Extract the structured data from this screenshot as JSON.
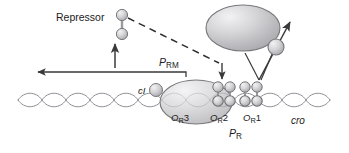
{
  "figure": {
    "background_color": "#ffffff"
  },
  "labels": {
    "repressor": "Repressor",
    "ci": "cI",
    "cro": "cro",
    "promoter_prm_base": "P",
    "promoter_prm_sub": "RM",
    "promoter_pr_base": "P",
    "promoter_pr_sub": "R",
    "or3_base": "O",
    "or3_sub": "R",
    "or3_num": "3",
    "or2_base": "O",
    "or2_sub": "R",
    "or2_num": "2",
    "or1_base": "O",
    "or1_sub": "R",
    "or1_num": "1"
  },
  "colors": {
    "dna_strand": "#8d8f96",
    "molecule_fill_light": "#e9e9ea",
    "molecule_fill_mid": "#bdbdc0",
    "molecule_fill_dark": "#9a9a9e",
    "molecule_stroke": "#78787c",
    "arrow": "#3a3a3a",
    "dashed_line": "#2e2e2e",
    "text": "#1c1c1c"
  },
  "elements": {
    "rna_polymerase_ellipse": "large gray ellipse representing RNA polymerase",
    "rna_polymerase_sigma": "small gray circle attached to polymerase",
    "repressor_dimer_free": "two stacked gray circles (free repressor dimer)",
    "ci_monomer_circle": "small gray circle left of OR3 bound protein",
    "or3_bound_protein": "large semi-transparent ellipse bound over OR3",
    "or2_dimer": "repressor dimer bound at OR2 (two upper + two lower circles)",
    "or1_dimer": "repressor dimer bound at OR1 (two upper + two lower circles)",
    "dna_double_helix": "double-helix DNA drawn as two interleaved sine waves",
    "leftward_transcription_arrow": "long arrow pointing left from PRM",
    "repressor_synthesis_arrow": "short upward arrow to repressor dimer",
    "dashed_binding_line": "dashed line from repressor dimer to OR region",
    "down_arrow_or2": "short down arrow into OR2",
    "polymerase_v_lines": "V-shaped lines from polymerase to OR1/OR2",
    "rightward_transcription_arrow": "arrow pointing up-right from polymerase"
  }
}
